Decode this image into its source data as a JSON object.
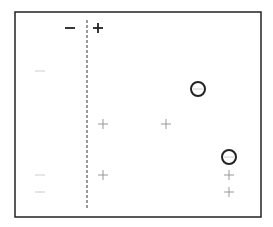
{
  "diagram": {
    "type": "decision-stump-illustration",
    "frame": {
      "x": 15,
      "y": 12,
      "width": 246,
      "height": 205,
      "color": "#222222"
    },
    "split_line": {
      "x": 87,
      "y1": 20,
      "y2": 210,
      "style": "dashed",
      "color": "#333333"
    },
    "side_labels": [
      {
        "text": "−",
        "x": 70,
        "y": 28,
        "color": "#222222",
        "meaning": "negative side"
      },
      {
        "text": "+",
        "x": 98,
        "y": 28,
        "color": "#222222",
        "meaning": "positive side"
      }
    ],
    "points": [
      {
        "label": "minus",
        "x": 40,
        "y": 71,
        "color": "#cccccc",
        "misclassified": false
      },
      {
        "label": "minus",
        "x": 198,
        "y": 89,
        "color": "#cccccc",
        "misclassified": true
      },
      {
        "label": "plus",
        "x": 103,
        "y": 124,
        "color": "#999999",
        "misclassified": false
      },
      {
        "label": "plus",
        "x": 166,
        "y": 124,
        "color": "#999999",
        "misclassified": false
      },
      {
        "label": "minus",
        "x": 229,
        "y": 157,
        "color": "#cccccc",
        "misclassified": true
      },
      {
        "label": "minus",
        "x": 40,
        "y": 175,
        "color": "#cccccc",
        "misclassified": false
      },
      {
        "label": "plus",
        "x": 103,
        "y": 175,
        "color": "#999999",
        "misclassified": false
      },
      {
        "label": "plus",
        "x": 229,
        "y": 175,
        "color": "#999999",
        "misclassified": false
      },
      {
        "label": "minus",
        "x": 40,
        "y": 192,
        "color": "#cccccc",
        "misclassified": false
      },
      {
        "label": "plus",
        "x": 229,
        "y": 192,
        "color": "#999999",
        "misclassified": false
      }
    ],
    "highlight_circle": {
      "radius": 7,
      "stroke": "#222222",
      "stroke_width": 2
    }
  }
}
